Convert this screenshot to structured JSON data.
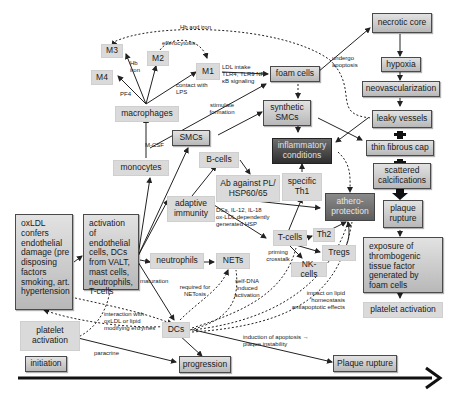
{
  "diagram": {
    "type": "flow-diagram",
    "title": "",
    "nodes": {
      "m3": "M3",
      "m2": "M2",
      "m4": "M4",
      "m1": "M1",
      "macrophages": "macrophages",
      "foam_cells": "foam cells",
      "necrotic_core": "necrotic core",
      "hypoxia": "hypoxia",
      "neovascularization": "neovascularization",
      "leaky_vessels": "leaky vessels",
      "thin_fibrous_cap": "thin fibrous cap",
      "scattered_calcifications": "scattered calcifications",
      "plaque_rupture_right": "plaque rupture",
      "exposure": "exposure of thrombogenic tissue factor generated by foam cells",
      "platelet_activation_right": "platelet activation",
      "synthetic_smcs": "synthetic SMCs",
      "inflammatory_conditions": "inflammatory conditions",
      "smcs": "SMCs",
      "monocytes": "monocytes",
      "b_cells": "B-cells",
      "ab_against": "Ab against PL/ HSP60/65",
      "specific_th1": "specific Th1",
      "athero_protection": "athero-protection",
      "adaptive_immunity": "adaptive immunity",
      "oxldl": "oxLDL confers endothelial damage (pre disposing factors smoking, art. hypertension",
      "activation": "activation of endothelial cells, DCs from VALT, mast cells, neutrophils, T-cells",
      "t_cells": "T-cells",
      "th2": "Th2",
      "tregs": "Tregs",
      "nk_cells": "NK-cells",
      "neutrophils": "neutrophils",
      "nets": "NETs",
      "platelet_activation_left": "platelet activation",
      "dcs": "DCs",
      "initiation": "initiation",
      "progression": "progression",
      "plaque_rupture_bottom": "Plaque rupture"
    },
    "edge_labels": {
      "hb_and_iron": "Hb and iron",
      "efferocytosis": "efferocytosis",
      "hb_iron": "Hb iron",
      "pf4": "PF4",
      "contact_lps": "contact with LPS",
      "ldl_intake": "LDL intake TLR4, TLR9 NF-κB signaling",
      "undergo_apoptosis": "undergo apoptosis",
      "stimulate_formation": "stimulate formation",
      "m_csf": "M-CSF",
      "dcs_il12": "DCs, IL-12, IL-18 ox-LDL dependently generated HSP",
      "priming_crosstalk": "priming crosstalk",
      "maturation": "maturation",
      "required_netosis": "required for NETosis",
      "self_dna": "self-DNA induced activation",
      "impact_lipid": "impact on lipid homeostasis antiapoptotic effects",
      "interaction_oxldl": "interaction with oxLDL or lipid modifying enzymes",
      "paracrine": "paracrine",
      "induction_apoptosis": "induction of apoptosis → plaque instability"
    },
    "timeline": {
      "stages": [
        "initiation",
        "progression",
        "Plaque rupture"
      ],
      "arrow_color": "#111111"
    },
    "colors": {
      "light_box": "#dadada",
      "mid_box": "#c4c4c4",
      "dark_box": "#3a3a3a",
      "line": "#222222"
    }
  }
}
